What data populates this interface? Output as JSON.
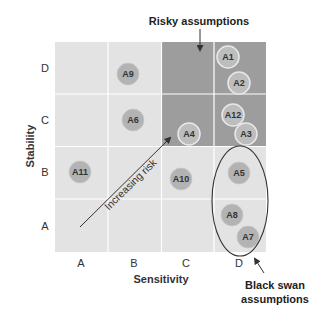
{
  "diagram": {
    "type": "risk-matrix",
    "title_callout": "Risky assumptions",
    "black_swan_callout": [
      "Black swan",
      "assumptions"
    ],
    "diagonal_label": "Increasing risk",
    "x_axis": {
      "title": "Sensitivity",
      "ticks": [
        "A",
        "B",
        "C",
        "D"
      ]
    },
    "y_axis": {
      "title": "Stability",
      "ticks": [
        "A",
        "B",
        "C",
        "D"
      ]
    },
    "colors": {
      "light_cell": "#e3e3e3",
      "dark_cell": "#9d9d9d",
      "grid_line": "#ffffff",
      "bubble_light": "#b3b3b3",
      "bubble_dark": "#bdbdbd",
      "text": "#333333"
    },
    "risky_region": {
      "columns": [
        "C",
        "D"
      ],
      "rows": [
        "C",
        "D"
      ]
    },
    "assumptions": [
      {
        "id": "A1",
        "sensitivity": "D",
        "stability": "D",
        "x": 228,
        "y": 57
      },
      {
        "id": "A2",
        "sensitivity": "D",
        "stability": "D",
        "x": 239,
        "y": 83
      },
      {
        "id": "A9",
        "sensitivity": "B",
        "stability": "D",
        "x": 128,
        "y": 74
      },
      {
        "id": "A6",
        "sensitivity": "B",
        "stability": "C",
        "x": 133,
        "y": 120
      },
      {
        "id": "A4",
        "sensitivity": "C",
        "stability": "C",
        "x": 189,
        "y": 134
      },
      {
        "id": "A12",
        "sensitivity": "D",
        "stability": "C",
        "x": 233,
        "y": 115
      },
      {
        "id": "A3",
        "sensitivity": "D",
        "stability": "C",
        "x": 246,
        "y": 134
      },
      {
        "id": "A11",
        "sensitivity": "A",
        "stability": "B",
        "x": 80,
        "y": 172
      },
      {
        "id": "A10",
        "sensitivity": "C",
        "stability": "B",
        "x": 181,
        "y": 179
      },
      {
        "id": "A5",
        "sensitivity": "D",
        "stability": "B",
        "x": 239,
        "y": 173
      },
      {
        "id": "A8",
        "sensitivity": "D",
        "stability": "A",
        "x": 232,
        "y": 215
      },
      {
        "id": "A7",
        "sensitivity": "D",
        "stability": "A",
        "x": 248,
        "y": 237
      }
    ]
  }
}
